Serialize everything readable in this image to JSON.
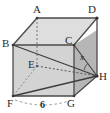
{
  "figure": {
    "kind": "geometry-diagram",
    "shape_name": "rectangular-box",
    "background_color": "#ffffff",
    "stroke_color": "#444444",
    "dashed_stroke_color": "#6b6b6b",
    "faces": {
      "top_fill": "#dcdcdc",
      "front_fill": "#d2d2d2",
      "right_fill": "#b4b4b4",
      "bottom_fill": "#c2c2c2"
    },
    "vertices": [
      {
        "id": "A",
        "label": "A",
        "x": 37,
        "y": 57,
        "label_x": 33,
        "label_y": 12
      },
      {
        "id": "B",
        "label": "B",
        "x": 13,
        "y": 45,
        "label_x": 2,
        "label_y": 46
      },
      {
        "id": "C",
        "label": "C",
        "x": 74,
        "y": 45,
        "label_x": 66,
        "label_y": 47
      },
      {
        "id": "D",
        "label": "D",
        "x": 97,
        "y": 57,
        "label_x": 88,
        "label_y": 13
      },
      {
        "id": "E",
        "label": "E",
        "x": 37,
        "y": 66,
        "label_x": 31,
        "label_y": 70
      },
      {
        "id": "F",
        "label": "F",
        "x": 13,
        "y": 96,
        "label_x": 8,
        "label_y": 105
      },
      {
        "id": "G",
        "label": "G",
        "x": 74,
        "y": 96,
        "label_x": 66,
        "label_y": 106
      },
      {
        "id": "H",
        "label": "H",
        "x": 97,
        "y": 76,
        "label_x": 95,
        "label_y": 80
      }
    ],
    "angle_label": {
      "text": "x",
      "x": 80,
      "y": 60
    },
    "dimension_label": {
      "text": "6",
      "x": 41,
      "y": 108,
      "between": [
        "F",
        "G"
      ]
    },
    "edges_solid": [
      "A-B",
      "A-D",
      "B-C",
      "C-D",
      "B-F",
      "C-G",
      "D-H",
      "F-G",
      "G-H",
      "C-H"
    ],
    "edges_dashed": [
      "A-E",
      "E-F",
      "E-H"
    ],
    "diagonals_solid": [
      "B-H",
      "F-H"
    ],
    "dimension_style": "dashed-arc"
  }
}
